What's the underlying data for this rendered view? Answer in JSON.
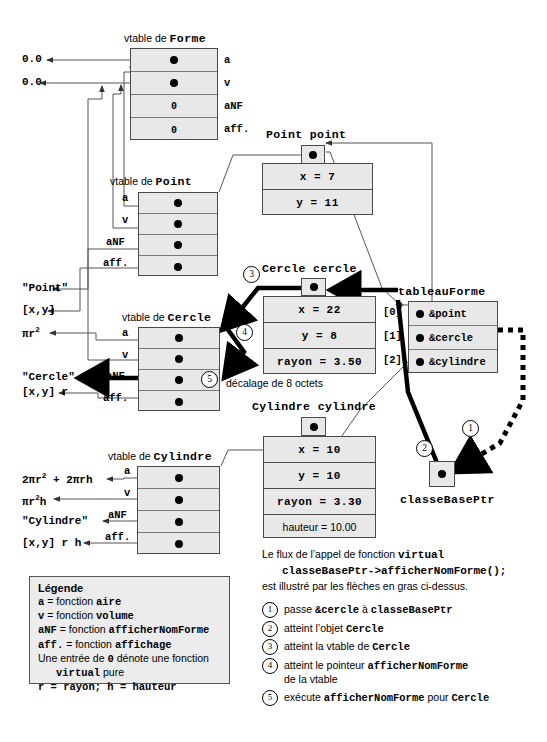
{
  "vtables": [
    {
      "id": "forme",
      "caption_prefix": "vtable de ",
      "caption_class": "Forme",
      "labels_side": "right",
      "slots": [
        {
          "label": "a",
          "value": "dot"
        },
        {
          "label": "v",
          "value": "dot"
        },
        {
          "label": "aNF",
          "value": "0"
        },
        {
          "label": "aff.",
          "value": "0"
        }
      ]
    },
    {
      "id": "point",
      "caption_prefix": "vtable de ",
      "caption_class": "Point",
      "labels_side": "left",
      "slots": [
        {
          "label": "a",
          "value": "dot"
        },
        {
          "label": "v",
          "value": "dot"
        },
        {
          "label": "aNF",
          "value": "dot"
        },
        {
          "label": "aff.",
          "value": "dot"
        }
      ]
    },
    {
      "id": "cercle",
      "caption_prefix": "vtable de ",
      "caption_class": "Cercle",
      "labels_side": "left",
      "slots": [
        {
          "label": "a",
          "value": "dot"
        },
        {
          "label": "v",
          "value": "dot"
        },
        {
          "label": "aNF",
          "value": "dot"
        },
        {
          "label": "aff.",
          "value": "dot"
        }
      ]
    },
    {
      "id": "cylindre",
      "caption_prefix": "vtable de ",
      "caption_class": "Cylindre",
      "labels_side": "left",
      "slots": [
        {
          "label": "a",
          "value": "dot"
        },
        {
          "label": "v",
          "value": "dot"
        },
        {
          "label": "aNF",
          "value": "dot"
        },
        {
          "label": "aff.",
          "value": "dot"
        }
      ]
    }
  ],
  "return_values": {
    "forme_a": "0.0",
    "forme_v": "0.0",
    "point_anf": "\"Point\"",
    "point_aff": "[x,y]",
    "cercle_a": "πr",
    "cercle_a_sup": "2",
    "cercle_anf": "\"Cercle\"",
    "cercle_aff": "[x,y] r",
    "cylindre_a": "2πr",
    "cylindre_a_sup": "2",
    "cylindre_a_rest": " + 2πrh",
    "cylindre_v": "πr",
    "cylindre_v_sup": "2",
    "cylindre_v_rest": "h",
    "cylindre_anf": "\"Cylindre\"",
    "cylindre_aff": "[x,y] r h"
  },
  "objects": [
    {
      "id": "point",
      "caption": "Point point",
      "fields": [
        {
          "text": "x = 7",
          "plain": false
        },
        {
          "text": "y = 11",
          "plain": false
        }
      ]
    },
    {
      "id": "cercle",
      "caption": "Cercle cercle",
      "fields": [
        {
          "text": "x = 22",
          "plain": false
        },
        {
          "text": "y = 8",
          "plain": false
        },
        {
          "text": "rayon = 3.50",
          "plain": false
        }
      ]
    },
    {
      "id": "cylindre",
      "caption": "Cylindre cylindre",
      "fields": [
        {
          "text": "x = 10",
          "plain": false
        },
        {
          "text": "y = 10",
          "plain": false
        },
        {
          "text": "rayon = 3.30",
          "plain": false
        },
        {
          "text": "hauteur = 10.00",
          "plain": true
        }
      ]
    }
  ],
  "offset_note": "décalage de 8 octets",
  "array": {
    "caption": "tableauForme",
    "rows": [
      {
        "index": "[0]",
        "value": "&point"
      },
      {
        "index": "[1]",
        "value": "&cercle"
      },
      {
        "index": "[2]",
        "value": "&cylindre"
      }
    ]
  },
  "base_ptr": {
    "caption": "classeBasePtr"
  },
  "flow_text": {
    "line1_pre": "Le flux de l’appel de fonction ",
    "line1_code": "virtual",
    "line2_code": "classeBasePtr->afficherNomForme();",
    "line3": "est illustré par les flèches en gras ci-dessus."
  },
  "legend": {
    "title": "Légende",
    "rows": [
      {
        "code": "a",
        "mid": " = fonction ",
        "code2": "aire"
      },
      {
        "code": "v",
        "mid": " = fonction ",
        "code2": "volume"
      },
      {
        "code": "aNF",
        "mid": " = fonction ",
        "code2": "afficherNomForme"
      },
      {
        "code": "aff.",
        "mid": " = fonction ",
        "code2": "affichage"
      }
    ],
    "note_pre": "Une entrée de ",
    "note_zero": "0",
    "note_post": " dénote une fonction",
    "note_ind_code": "virtual",
    "note_ind_post": " pure",
    "radius_line": "r = rayon; h = hauteur"
  },
  "steps": [
    {
      "num": "1",
      "pre": "passe ",
      "code": "&cercle",
      "mid": " à ",
      "code2": "classeBasePtr",
      "post": "",
      "sub": ""
    },
    {
      "num": "2",
      "pre": "atteint l’objet ",
      "code": "Cercle",
      "mid": "",
      "code2": "",
      "post": "",
      "sub": ""
    },
    {
      "num": "3",
      "pre": "atteint la vtable de ",
      "code": "Cercle",
      "mid": "",
      "code2": "",
      "post": "",
      "sub": ""
    },
    {
      "num": "4",
      "pre": "atteint le pointeur ",
      "code": "afficherNomForme",
      "mid": "",
      "code2": "",
      "post": "",
      "sub": "de la vtable"
    },
    {
      "num": "5",
      "pre": "exécute ",
      "code": "afficherNomForme",
      "mid": " pour ",
      "code2": "Cercle",
      "post": "",
      "sub": ""
    }
  ],
  "markers": [
    "1",
    "2",
    "3",
    "4",
    "5"
  ],
  "colors": {
    "box_fill": "#e8e8e8",
    "box_border": "#4a4a4a",
    "thin_line": "#555555",
    "bold_line": "#000000"
  }
}
